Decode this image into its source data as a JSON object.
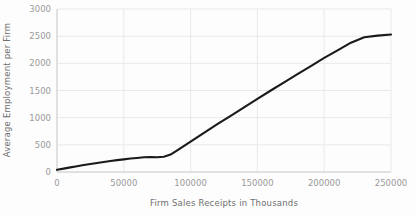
{
  "chart_data": {
    "type": "line",
    "title": "",
    "xlabel": "Firm Sales Receipts in Thousands",
    "ylabel": "Average Employment per Firm",
    "xlim": [
      0,
      250000
    ],
    "ylim": [
      0,
      3000
    ],
    "grid": true,
    "legend": false,
    "xticks": [
      0,
      50000,
      100000,
      150000,
      200000,
      250000
    ],
    "xtick_labels": [
      "0",
      "50000",
      "100000",
      "150000",
      "200000",
      "250000"
    ],
    "yticks": [
      0,
      500,
      1000,
      1500,
      2000,
      2500,
      3000
    ],
    "ytick_labels": [
      "0",
      "500",
      "1000",
      "1500",
      "2000",
      "2500",
      "3000"
    ],
    "line_color": "#1a1a1a",
    "grid_color": "#e9e9e9",
    "series": [
      {
        "name": "Average Employment per Firm",
        "x": [
          0,
          5000,
          10000,
          15000,
          20000,
          25000,
          30000,
          35000,
          40000,
          45000,
          50000,
          55000,
          60000,
          65000,
          70000,
          75000,
          80000,
          85000,
          90000,
          100000,
          110000,
          120000,
          130000,
          140000,
          150000,
          160000,
          170000,
          180000,
          190000,
          200000,
          210000,
          220000,
          230000,
          240000,
          250000
        ],
        "values": [
          40,
          62,
          85,
          107,
          128,
          148,
          167,
          185,
          202,
          218,
          233,
          247,
          259,
          272,
          276,
          272,
          280,
          320,
          400,
          560,
          720,
          880,
          1035,
          1190,
          1345,
          1500,
          1650,
          1800,
          1950,
          2100,
          2240,
          2380,
          2480,
          2510,
          2530
        ]
      }
    ]
  },
  "axes": {
    "x_title": "Firm Sales Receipts in Thousands",
    "y_title": "Average Employment per Firm"
  }
}
